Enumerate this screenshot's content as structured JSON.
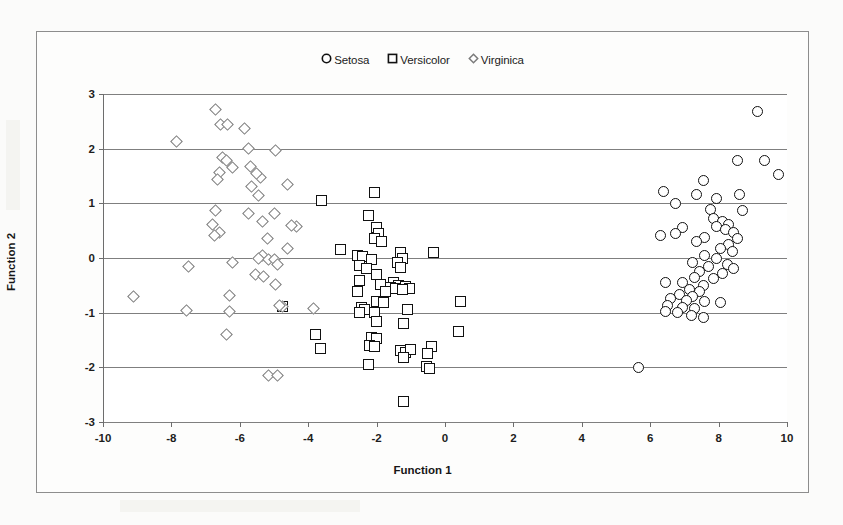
{
  "chart_data": {
    "type": "scatter",
    "title": "",
    "xlabel": "Function 1",
    "ylabel": "Function 2",
    "xlim": [
      -10,
      10
    ],
    "ylim": [
      -3,
      3
    ],
    "xticks": [
      "-10",
      "-8",
      "-6",
      "-4",
      "-2",
      "0",
      "2",
      "4",
      "6",
      "8",
      "10"
    ],
    "xtick_values": [
      -10,
      -8,
      -6,
      -4,
      -2,
      0,
      2,
      4,
      6,
      8,
      10
    ],
    "yticks": [
      "3",
      "2",
      "1",
      "0",
      "-1",
      "-2",
      "-3"
    ],
    "ytick_values": [
      3,
      2,
      1,
      0,
      -1,
      -2,
      -3
    ],
    "grid": "horizontal",
    "legend_position": "top-center",
    "series": [
      {
        "name": "Setosa",
        "marker": "circle",
        "color": "#101010",
        "points": [
          [
            9.15,
            2.68
          ],
          [
            8.55,
            1.79
          ],
          [
            9.35,
            1.79
          ],
          [
            9.75,
            1.53
          ],
          [
            7.55,
            1.42
          ],
          [
            6.4,
            1.22
          ],
          [
            7.35,
            1.16
          ],
          [
            8.6,
            1.16
          ],
          [
            6.75,
            1.0
          ],
          [
            7.95,
            1.08
          ],
          [
            7.75,
            0.88
          ],
          [
            8.7,
            0.86
          ],
          [
            7.85,
            0.72
          ],
          [
            8.1,
            0.66
          ],
          [
            8.3,
            0.62
          ],
          [
            7.95,
            0.58
          ],
          [
            8.2,
            0.52
          ],
          [
            6.95,
            0.56
          ],
          [
            6.3,
            0.42
          ],
          [
            6.75,
            0.44
          ],
          [
            8.45,
            0.46
          ],
          [
            7.6,
            0.38
          ],
          [
            8.55,
            0.36
          ],
          [
            7.35,
            0.3
          ],
          [
            8.3,
            0.25
          ],
          [
            8.05,
            0.18
          ],
          [
            8.4,
            0.12
          ],
          [
            7.6,
            0.05
          ],
          [
            7.95,
            0.0
          ],
          [
            7.25,
            -0.08
          ],
          [
            8.25,
            -0.12
          ],
          [
            7.7,
            -0.15
          ],
          [
            8.45,
            -0.2
          ],
          [
            7.45,
            -0.25
          ],
          [
            8.1,
            -0.28
          ],
          [
            7.3,
            -0.35
          ],
          [
            7.85,
            -0.38
          ],
          [
            6.45,
            -0.44
          ],
          [
            6.95,
            -0.45
          ],
          [
            7.55,
            -0.5
          ],
          [
            7.15,
            -0.58
          ],
          [
            7.45,
            -0.62
          ],
          [
            6.85,
            -0.66
          ],
          [
            7.25,
            -0.7
          ],
          [
            6.6,
            -0.74
          ],
          [
            7.05,
            -0.78
          ],
          [
            7.6,
            -0.8
          ],
          [
            8.05,
            -0.82
          ],
          [
            6.5,
            -0.86
          ],
          [
            6.95,
            -0.9
          ],
          [
            7.3,
            -0.92
          ],
          [
            6.45,
            -0.98
          ],
          [
            6.8,
            -1.0
          ],
          [
            7.2,
            -1.05
          ],
          [
            7.55,
            -1.08
          ],
          [
            5.65,
            -2.0
          ]
        ]
      },
      {
        "name": "Versicolor",
        "marker": "square",
        "color": "#111111",
        "points": [
          [
            -2.05,
            1.2
          ],
          [
            -3.6,
            1.06
          ],
          [
            -2.25,
            0.78
          ],
          [
            -2.0,
            0.56
          ],
          [
            -1.95,
            0.45
          ],
          [
            -2.05,
            0.36
          ],
          [
            -1.85,
            0.3
          ],
          [
            -3.05,
            0.16
          ],
          [
            -1.3,
            0.1
          ],
          [
            -0.35,
            0.1
          ],
          [
            -2.55,
            0.04
          ],
          [
            -2.4,
            0.02
          ],
          [
            -1.25,
            0.0
          ],
          [
            -2.15,
            -0.02
          ],
          [
            -1.4,
            -0.08
          ],
          [
            -2.5,
            -0.14
          ],
          [
            -1.3,
            -0.18
          ],
          [
            -2.3,
            -0.2
          ],
          [
            -2.0,
            -0.3
          ],
          [
            -2.5,
            -0.42
          ],
          [
            -1.5,
            -0.45
          ],
          [
            -1.9,
            -0.48
          ],
          [
            -1.35,
            -0.5
          ],
          [
            -1.15,
            -0.52
          ],
          [
            -1.6,
            -0.54
          ],
          [
            -1.05,
            -0.55
          ],
          [
            -1.45,
            -0.56
          ],
          [
            -1.25,
            -0.58
          ],
          [
            -2.55,
            -0.62
          ],
          [
            -1.75,
            -0.62
          ],
          [
            -4.75,
            -0.88
          ],
          [
            -2.0,
            -0.8
          ],
          [
            -1.8,
            -0.82
          ],
          [
            0.45,
            -0.8
          ],
          [
            -2.45,
            -0.9
          ],
          [
            -2.35,
            -0.94
          ],
          [
            -1.1,
            -0.95
          ],
          [
            -2.5,
            -1.0
          ],
          [
            -2.05,
            -1.0
          ],
          [
            -2.0,
            -1.16
          ],
          [
            -1.2,
            -1.2
          ],
          [
            -3.8,
            -1.4
          ],
          [
            -2.15,
            -1.45
          ],
          [
            -2.0,
            -1.48
          ],
          [
            0.4,
            -1.35
          ],
          [
            -3.65,
            -1.65
          ],
          [
            -2.2,
            -1.6
          ],
          [
            -2.05,
            -1.62
          ],
          [
            -1.3,
            -1.7
          ],
          [
            -1.15,
            -1.72
          ],
          [
            -1.0,
            -1.68
          ],
          [
            -0.4,
            -1.62
          ],
          [
            -0.5,
            -1.75
          ],
          [
            -1.2,
            -1.82
          ],
          [
            -2.25,
            -1.95
          ],
          [
            -0.55,
            -1.98
          ],
          [
            -0.45,
            -2.02
          ],
          [
            -1.2,
            -2.62
          ]
        ]
      },
      {
        "name": "Virginica",
        "marker": "diamond",
        "color": "#7b7b7b",
        "points": [
          [
            -6.7,
            2.72
          ],
          [
            -6.55,
            2.45
          ],
          [
            -6.35,
            2.44
          ],
          [
            -5.85,
            2.36
          ],
          [
            -7.85,
            2.14
          ],
          [
            -5.75,
            2.0
          ],
          [
            -4.95,
            1.97
          ],
          [
            -6.5,
            1.84
          ],
          [
            -6.4,
            1.78
          ],
          [
            -6.2,
            1.66
          ],
          [
            -5.7,
            1.68
          ],
          [
            -6.6,
            1.56
          ],
          [
            -6.65,
            1.44
          ],
          [
            -5.4,
            1.48
          ],
          [
            -5.5,
            1.55
          ],
          [
            -5.65,
            1.3
          ],
          [
            -5.45,
            1.15
          ],
          [
            -4.6,
            1.35
          ],
          [
            -6.7,
            0.86
          ],
          [
            -5.75,
            0.82
          ],
          [
            -5.0,
            0.82
          ],
          [
            -6.8,
            0.62
          ],
          [
            -5.35,
            0.66
          ],
          [
            -4.35,
            0.58
          ],
          [
            -6.6,
            0.46
          ],
          [
            -6.75,
            0.42
          ],
          [
            -5.2,
            0.35
          ],
          [
            -4.5,
            0.6
          ],
          [
            -4.6,
            0.18
          ],
          [
            -5.35,
            0.05
          ],
          [
            -5.45,
            0.0
          ],
          [
            -5.15,
            -0.02
          ],
          [
            -5.0,
            -0.02
          ],
          [
            -6.2,
            -0.08
          ],
          [
            -7.5,
            -0.15
          ],
          [
            -4.9,
            -0.12
          ],
          [
            -5.55,
            -0.3
          ],
          [
            -5.3,
            -0.34
          ],
          [
            -4.95,
            -0.48
          ],
          [
            -9.1,
            -0.7
          ],
          [
            -6.3,
            -0.68
          ],
          [
            -7.55,
            -0.96
          ],
          [
            -6.3,
            -0.98
          ],
          [
            -4.75,
            -0.88
          ],
          [
            -4.85,
            -0.86
          ],
          [
            -3.85,
            -0.92
          ],
          [
            -6.4,
            -1.4
          ],
          [
            -5.15,
            -2.15
          ],
          [
            -4.9,
            -2.15
          ]
        ]
      }
    ]
  },
  "legend": {
    "items": [
      {
        "label": "Setosa",
        "marker": "circle"
      },
      {
        "label": "Versicolor",
        "marker": "square"
      },
      {
        "label": "Virginica",
        "marker": "diamond"
      }
    ]
  },
  "axes": {
    "x_title": "Function 1",
    "y_title": "Function 2"
  }
}
